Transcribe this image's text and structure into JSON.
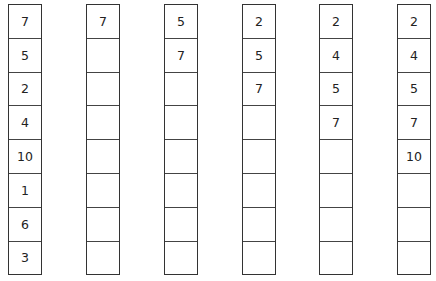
{
  "diagram": {
    "columns": [
      {
        "cells": [
          "7",
          "5",
          "2",
          "4",
          "10",
          "1",
          "6",
          "3"
        ]
      },
      {
        "cells": [
          "7",
          "",
          "",
          "",
          "",
          "",
          "",
          ""
        ]
      },
      {
        "cells": [
          "5",
          "7",
          "",
          "",
          "",
          "",
          "",
          ""
        ]
      },
      {
        "cells": [
          "2",
          "5",
          "7",
          "",
          "",
          "",
          "",
          ""
        ]
      },
      {
        "cells": [
          "2",
          "4",
          "5",
          "7",
          "",
          "",
          "",
          ""
        ]
      },
      {
        "cells": [
          "2",
          "4",
          "5",
          "7",
          "10",
          "",
          "",
          ""
        ]
      }
    ],
    "column_left_px": [
      8,
      86,
      164,
      242,
      319,
      397
    ]
  }
}
